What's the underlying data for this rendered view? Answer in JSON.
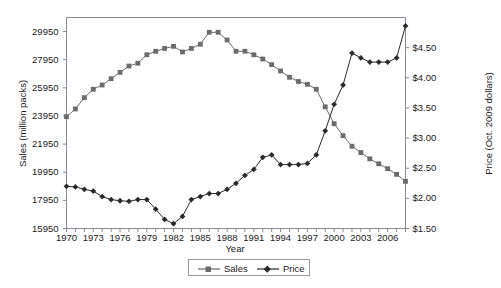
{
  "chart_data": {
    "type": "line",
    "title": "",
    "xlabel": "Year",
    "ylabel": "Sales (million packs)",
    "y2label": "Price (Oct. 2009 dollars)",
    "x": [
      1970,
      1971,
      1972,
      1973,
      1974,
      1975,
      1976,
      1977,
      1978,
      1979,
      1980,
      1981,
      1982,
      1983,
      1984,
      1985,
      1986,
      1987,
      1988,
      1989,
      1990,
      1991,
      1992,
      1993,
      1994,
      1995,
      1996,
      1997,
      1998,
      1999,
      2000,
      2001,
      2002,
      2003,
      2004,
      2005,
      2006,
      2007,
      2008
    ],
    "xlim": [
      1970,
      2008
    ],
    "xticks": [
      1970,
      1973,
      1976,
      1979,
      1982,
      1985,
      1988,
      1991,
      1994,
      1997,
      2000,
      2003,
      2006
    ],
    "xticklabels": [
      "1970",
      "1973",
      "1976",
      "1979",
      "1982",
      "1985",
      "1988",
      "1991",
      "1994",
      "1997",
      "2000",
      "2003",
      "2006"
    ],
    "ylim": [
      15950,
      30950
    ],
    "yticks": [
      15950,
      17950,
      19950,
      21950,
      23950,
      25950,
      27950,
      29950
    ],
    "yticklabels": [
      "15950",
      "17950",
      "19950",
      "21950",
      "23950",
      "25950",
      "27950",
      "29950"
    ],
    "y2lim": [
      1.5,
      5.0
    ],
    "y2ticks": [
      1.5,
      2.0,
      2.5,
      3.0,
      3.5,
      4.0,
      4.5
    ],
    "y2ticklabels": [
      "$1.50",
      "$2.00",
      "$2.50",
      "$3.00",
      "$3.50",
      "$4.00",
      "$4.50"
    ],
    "grid": false,
    "legend_position": "bottom-center",
    "series": [
      {
        "name": "Sales",
        "axis": "left",
        "marker": "square",
        "color": "#6b6b6b",
        "values": [
          23900,
          24450,
          25250,
          25850,
          26150,
          26600,
          27050,
          27500,
          27700,
          28300,
          28550,
          28750,
          28900,
          28500,
          28750,
          29050,
          29900,
          29900,
          29350,
          28550,
          28550,
          28300,
          28000,
          27600,
          27150,
          26700,
          26400,
          26200,
          25850,
          24600,
          23400,
          22550,
          21800,
          21350,
          20900,
          20550,
          20200,
          19800,
          19300
        ]
      },
      {
        "name": "Price",
        "axis": "right",
        "marker": "diamond",
        "color": "#2a2a2a",
        "values": [
          2.2,
          2.19,
          2.15,
          2.12,
          2.03,
          1.98,
          1.96,
          1.95,
          1.98,
          1.98,
          1.82,
          1.65,
          1.58,
          1.7,
          1.98,
          2.03,
          2.08,
          2.08,
          2.15,
          2.25,
          2.38,
          2.48,
          2.68,
          2.72,
          2.56,
          2.56,
          2.56,
          2.58,
          2.72,
          3.12,
          3.56,
          3.88,
          4.41,
          4.33,
          4.26,
          4.26,
          4.26,
          4.33,
          4.86
        ]
      }
    ]
  },
  "axes": {
    "x_title": "Year",
    "y_left_title": "Sales (million packs)",
    "y_right_title": "Price (Oct. 2009 dollars)"
  },
  "legend": {
    "items": [
      {
        "label": "Sales"
      },
      {
        "label": "Price"
      }
    ]
  }
}
